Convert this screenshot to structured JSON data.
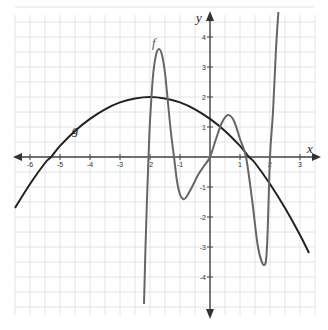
{
  "chart_data": {
    "type": "line",
    "title": "",
    "xlabel": "x",
    "ylabel": "y",
    "xlim": [
      -6.5,
      3.5
    ],
    "ylim": [
      -5,
      5
    ],
    "grid": true,
    "grid_step": 0.5,
    "x_ticks": [
      -6,
      -5,
      -4,
      -3,
      -2,
      -1,
      1,
      2,
      3
    ],
    "x_tick_labels": [
      "-6",
      "-5",
      "-4",
      "-3",
      "-2",
      "-1",
      "1",
      "2",
      "3"
    ],
    "y_ticks": [
      4,
      3,
      2,
      1,
      -1,
      -2,
      -3,
      -4
    ],
    "y_tick_labels": [
      "4",
      "3",
      "2",
      "1",
      "-1",
      "-2",
      "-3",
      "-4"
    ],
    "series": [
      {
        "name": "g",
        "color": "#222222",
        "description": "downward parabola, vertex (-2, 2), roots near -5.3 and 1.3",
        "points": [
          [
            -6.5,
            -1.7
          ],
          [
            -6,
            -0.9
          ],
          [
            -5.5,
            -0.2
          ],
          [
            -5.3,
            0
          ],
          [
            -5,
            0.37
          ],
          [
            -4.5,
            0.87
          ],
          [
            -4,
            1.27
          ],
          [
            -3.5,
            1.59
          ],
          [
            -3,
            1.82
          ],
          [
            -2.5,
            1.95
          ],
          [
            -2,
            2
          ],
          [
            -1.5,
            1.95
          ],
          [
            -1,
            1.82
          ],
          [
            -0.5,
            1.59
          ],
          [
            0,
            1.27
          ],
          [
            0.5,
            0.87
          ],
          [
            1,
            0.37
          ],
          [
            1.3,
            0
          ],
          [
            1.5,
            -0.2
          ],
          [
            2,
            -0.9
          ],
          [
            2.5,
            -1.7
          ],
          [
            3,
            -2.6
          ],
          [
            3.3,
            -3.2
          ]
        ]
      },
      {
        "name": "f",
        "color": "#666666",
        "description": "oscillating polynomial: max (-1.7, 3.6), min (-0.9, -1.4), max (0.6, 1.4), min (1.8, -3.6); roots near -2.05, -1.2, 0, 1.2, 2",
        "points": [
          [
            -2.2,
            -4.9
          ],
          [
            -2.15,
            -3.0
          ],
          [
            -2.1,
            -1.4
          ],
          [
            -2.05,
            0
          ],
          [
            -2.0,
            1.2
          ],
          [
            -1.9,
            2.7
          ],
          [
            -1.8,
            3.4
          ],
          [
            -1.7,
            3.6
          ],
          [
            -1.6,
            3.4
          ],
          [
            -1.5,
            2.8
          ],
          [
            -1.4,
            1.8
          ],
          [
            -1.3,
            0.8
          ],
          [
            -1.2,
            0
          ],
          [
            -1.1,
            -0.8
          ],
          [
            -1.0,
            -1.25
          ],
          [
            -0.9,
            -1.4
          ],
          [
            -0.8,
            -1.35
          ],
          [
            -0.6,
            -1.0
          ],
          [
            -0.4,
            -0.6
          ],
          [
            -0.2,
            -0.3
          ],
          [
            0,
            0
          ],
          [
            0.2,
            0.6
          ],
          [
            0.4,
            1.15
          ],
          [
            0.6,
            1.4
          ],
          [
            0.8,
            1.2
          ],
          [
            1.0,
            0.6
          ],
          [
            1.2,
            0
          ],
          [
            1.4,
            -1.4
          ],
          [
            1.6,
            -3.0
          ],
          [
            1.8,
            -3.6
          ],
          [
            1.9,
            -3.0
          ],
          [
            2.0,
            0
          ],
          [
            2.1,
            1.5
          ],
          [
            2.2,
            3.6
          ],
          [
            2.28,
            5.0
          ]
        ]
      }
    ],
    "annotations": [
      {
        "text": "f",
        "x": -1.9,
        "y": 3.8
      },
      {
        "text": "g",
        "x": -4.6,
        "y": 0.85
      }
    ]
  },
  "axes": {
    "x_name": "x",
    "y_name": "y"
  },
  "labels": {
    "f": "f",
    "g": "g"
  },
  "colors": {
    "grid": "#dddddd",
    "axis": "#444444",
    "g": "#222222",
    "f": "#6a6a6a"
  }
}
